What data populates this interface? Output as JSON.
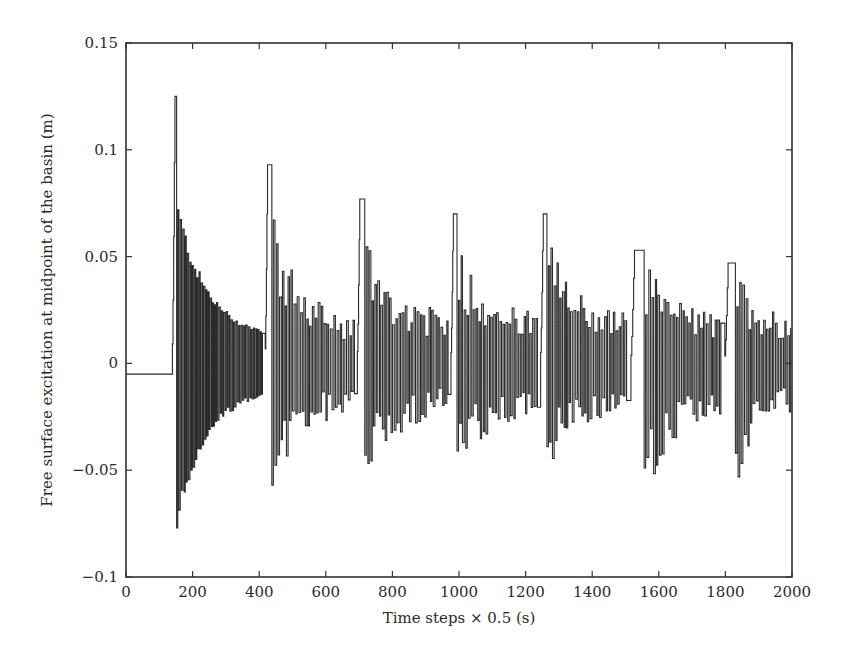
{
  "chart_data": {
    "type": "line",
    "title": "",
    "xlabel": "Time steps × 0.5 (s)",
    "ylabel": "Free surface excitation at midpoint of the basin (m)",
    "xlim": [
      0,
      2000
    ],
    "ylim": [
      -0.1,
      0.15
    ],
    "grid": false,
    "legend": null,
    "x_ticks": [
      0,
      200,
      400,
      600,
      800,
      1000,
      1200,
      1400,
      1600,
      1800,
      2000
    ],
    "x_tick_labels": [
      "0",
      "200",
      "400",
      "600",
      "800",
      "1000",
      "1200",
      "1400",
      "1600",
      "1800",
      "2000"
    ],
    "y_ticks": [
      -0.1,
      -0.05,
      0,
      0.05,
      0.1,
      0.15
    ],
    "y_tick_labels": [
      "−0.1",
      "−0.05",
      "0",
      "0.05",
      "0.1",
      "0.15"
    ],
    "series": [
      {
        "name": "free surface excitation",
        "color": "#2b2b2b",
        "baseline": {
          "x_start": 0,
          "x_end": 130,
          "value": -0.005
        },
        "wave_events": [
          {
            "x_peak": 147,
            "peak": 0.125,
            "x_min": 152,
            "min": -0.077,
            "decay_to": 0.012,
            "x_end": 415
          },
          {
            "x_peak": 425,
            "peak": 0.093,
            "x_min": 438,
            "min": -0.057,
            "decay_to": 0.018,
            "x_end": 690
          },
          {
            "x_peak": 702,
            "peak": 0.077,
            "x_min": 717,
            "min": -0.043,
            "decay_to": 0.02,
            "x_end": 970
          },
          {
            "x_peak": 983,
            "peak": 0.07,
            "x_min": 994,
            "min": -0.041,
            "decay_to": 0.02,
            "x_end": 1240
          },
          {
            "x_peak": 1253,
            "peak": 0.07,
            "x_min": 1264,
            "min": -0.039,
            "decay_to": 0.02,
            "x_end": 1510
          },
          {
            "x_peak": 1527,
            "peak": 0.053,
            "x_min": 1556,
            "min": -0.049,
            "decay_to": 0.02,
            "x_end": 1790
          },
          {
            "x_peak": 1808,
            "peak": 0.047,
            "x_min": 1830,
            "min": -0.042,
            "decay_to": 0.02,
            "x_end": 2000
          }
        ]
      }
    ]
  }
}
